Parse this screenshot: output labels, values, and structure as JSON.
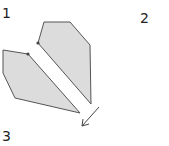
{
  "labels": {
    "one": "1",
    "two": "2",
    "three": "3"
  },
  "colors": {
    "fill": "#dcdcdc",
    "stroke": "#555555"
  }
}
